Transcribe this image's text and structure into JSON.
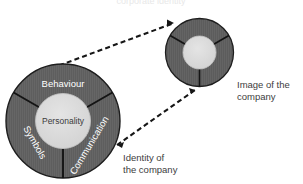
{
  "diagram": {
    "title_cut_off": "corporate identity",
    "background_color": "#ffffff",
    "segment_fill_color": "#5e5e5e",
    "segment_stroke_color": "#1c1c1c",
    "core_fill_color": "#d9d9d9",
    "connector_color": "#161616",
    "segment_text_color": "#ffffff",
    "core_text_color": "#3a3a3a",
    "callout_text_color": "#3d3d3d"
  },
  "identity_wheel": {
    "name": "identity-wheel",
    "core_label": "Personality",
    "segments": [
      {
        "id": "behaviour",
        "label": "Behaviour"
      },
      {
        "id": "communication",
        "label": "Communication"
      },
      {
        "id": "symbols",
        "label": "Symbols"
      }
    ],
    "caption_line1": "Identity of",
    "caption_line2": "the company"
  },
  "image_wheel": {
    "name": "image-wheel",
    "core_label": "",
    "segments": [
      {
        "id": "image-seg-1",
        "label": ""
      },
      {
        "id": "image-seg-2",
        "label": ""
      },
      {
        "id": "image-seg-3",
        "label": ""
      }
    ],
    "caption_line1": "Image of the",
    "caption_line2": "company"
  },
  "connectors": [
    {
      "id": "connector-top",
      "style": "dashed",
      "from": "identity-wheel",
      "to": "image-wheel"
    },
    {
      "id": "connector-bottom",
      "style": "dashed",
      "from": "identity-wheel",
      "to": "image-wheel"
    }
  ]
}
